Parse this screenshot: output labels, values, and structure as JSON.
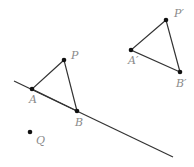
{
  "colors": {
    "stroke": "#333333",
    "label": "#8a8a8a"
  },
  "points": {
    "P": {
      "label": "P",
      "x": 64,
      "y": 60
    },
    "A": {
      "label": "A",
      "x": 32,
      "y": 89
    },
    "B": {
      "label": "B",
      "x": 77,
      "y": 111
    },
    "Q": {
      "label": "Q",
      "x": 30,
      "y": 132
    },
    "Pp": {
      "label": "P′",
      "x": 166,
      "y": 20
    },
    "Ap": {
      "label": "A′",
      "x": 131,
      "y": 50
    },
    "Bp": {
      "label": "B′",
      "x": 180,
      "y": 72
    }
  },
  "line": {
    "x1": 14,
    "y1": 81,
    "x2": 173,
    "y2": 157
  }
}
